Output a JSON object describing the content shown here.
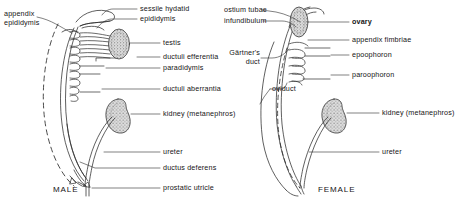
{
  "figure": {
    "panels": [
      {
        "id": "male",
        "caption": "MALE",
        "left_labels": [
          {
            "name": "appendix-epididymis",
            "text": "appendix\nepididymis"
          }
        ],
        "right_labels": [
          {
            "name": "sessile-hydatid",
            "text": "sessile hydatid"
          },
          {
            "name": "epididymis",
            "text": "epididymis"
          },
          {
            "name": "testis",
            "text": "testis"
          },
          {
            "name": "ductuli-efferentia",
            "text": "ductuli efferentia"
          },
          {
            "name": "paradidymis",
            "text": "paradidymis"
          },
          {
            "name": "ductuli-aberrantia",
            "text": "ductuli aberrantia"
          },
          {
            "name": "kidney-metanephros",
            "text": "kidney (metanephros)"
          },
          {
            "name": "ureter",
            "text": "ureter"
          },
          {
            "name": "ductus-deferens",
            "text": "ductus deferens"
          },
          {
            "name": "prostatic-utricle",
            "text": "prostatic utricle"
          }
        ]
      },
      {
        "id": "female",
        "caption": "FEMALE",
        "left_labels": [
          {
            "name": "ostium-tubae",
            "text": "ostium tubae"
          },
          {
            "name": "infundibulum",
            "text": "infundibulum"
          },
          {
            "name": "gartners-duct",
            "text": "Gärtner's\nduct"
          }
        ],
        "inner_labels": [
          {
            "name": "oviduct",
            "text": "oviduct"
          }
        ],
        "right_labels": [
          {
            "name": "ovary",
            "text": "ovary"
          },
          {
            "name": "appendix-fimbriae",
            "text": "appendix fimbriae"
          },
          {
            "name": "epoophoron",
            "text": "epoophoron"
          },
          {
            "name": "paroophoron",
            "text": "paroophoron"
          },
          {
            "name": "kidney-metanephros",
            "text": "kidney (metanephros)"
          },
          {
            "name": "ureter",
            "text": "ureter"
          }
        ]
      }
    ],
    "colors": {
      "ink": "#1a1a1a",
      "line": "#2b2b2b",
      "stipple": "#6e6e6e",
      "organ_fill": "#d6d6d6",
      "paper": "#ffffff"
    }
  }
}
